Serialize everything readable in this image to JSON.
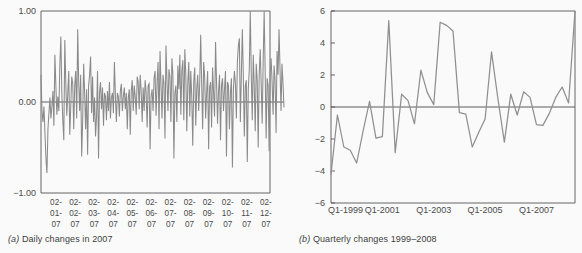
{
  "figure": {
    "background": "#fafafa",
    "line_color": "#8a8a8a",
    "axis_color": "#555555",
    "text_color": "#3d3d3d"
  },
  "panel_a": {
    "caption_label": "(a)",
    "caption_text": " Daily changes in 2007"
  },
  "panel_b": {
    "caption_label": "(b)",
    "caption_text": " Quarterly changes 1999–2008"
  },
  "chart_data": [
    {
      "id": "daily-changes-2007",
      "type": "line",
      "title": "(a) Daily changes in 2007",
      "xlabel": "",
      "ylabel": "",
      "ylim": [
        -1.0,
        1.0
      ],
      "yticks": [
        1.0,
        0.0,
        -1.0
      ],
      "ytick_labels": [
        "1.00",
        "0.00",
        "−1.00"
      ],
      "grid": false,
      "legend": "none",
      "zero_line": 0.0,
      "xtick_labels": [
        [
          "02-",
          "01-",
          "07"
        ],
        [
          "02-",
          "02-",
          "07"
        ],
        [
          "02-",
          "03-",
          "07"
        ],
        [
          "02-",
          "04-",
          "07"
        ],
        [
          "02-",
          "05-",
          "07"
        ],
        [
          "02-",
          "06-",
          "07"
        ],
        [
          "02-",
          "07-",
          "07"
        ],
        [
          "02-",
          "08-",
          "07"
        ],
        [
          "02-",
          "09-",
          "07"
        ],
        [
          "02-",
          "10-",
          "07"
        ],
        [
          "02-",
          "11-",
          "07"
        ],
        [
          "02-",
          "12-",
          "07"
        ]
      ],
      "values": [
        0.3,
        -0.1,
        -0.22,
        -0.05,
        -0.35,
        -0.62,
        -0.78,
        -0.3,
        -0.12,
        0.05,
        -0.18,
        -0.05,
        0.12,
        -0.26,
        0.52,
        0.18,
        -0.14,
        0.06,
        -0.1,
        0.4,
        0.72,
        0.1,
        -0.2,
        -0.42,
        0.68,
        0.2,
        -0.15,
        0.1,
        0.34,
        -0.36,
        -0.05,
        0.28,
        0.2,
        -0.3,
        0.18,
        0.34,
        -0.18,
        0.8,
        0.22,
        -0.1,
        0.3,
        -0.6,
        -0.2,
        0.42,
        0.1,
        -0.3,
        0.14,
        -0.58,
        0.18,
        0.3,
        0.5,
        -0.12,
        0.28,
        -0.22,
        0.05,
        -0.38,
        -0.16,
        0.34,
        -0.62,
        0.1,
        0.22,
        -0.08,
        0.16,
        -0.26,
        0.1,
        0.06,
        -0.2,
        0.12,
        -0.1,
        0.22,
        -0.18,
        0.05,
        0.1,
        -0.12,
        0.44,
        0.08,
        -0.22,
        0.1,
        0.06,
        -0.16,
        0.12,
        0.2,
        -0.1,
        0.06,
        0.16,
        -0.08,
        0.1,
        -0.3,
        0.05,
        0.14,
        -0.36,
        0.12,
        0.24,
        -0.1,
        0.18,
        0.06,
        -0.14,
        0.28,
        0.22,
        -0.08,
        0.3,
        0.12,
        -0.22,
        0.16,
        -0.1,
        0.24,
        0.1,
        -0.28,
        0.18,
        0.2,
        -0.52,
        0.06,
        0.14,
        -0.1,
        0.26,
        0.34,
        -0.15,
        0.2,
        0.44,
        -0.3,
        0.56,
        0.18,
        -0.18,
        0.3,
        0.2,
        -0.4,
        0.62,
        0.24,
        -0.1,
        0.36,
        0.28,
        -0.22,
        0.48,
        0.3,
        -0.62,
        0.1,
        0.18,
        -0.22,
        0.4,
        0.14,
        0.52,
        -0.14,
        0.34,
        0.46,
        -0.2,
        0.58,
        0.3,
        -0.32,
        0.2,
        0.44,
        -0.16,
        0.34,
        0.06,
        -0.48,
        0.22,
        0.38,
        -0.26,
        0.14,
        0.3,
        -0.1,
        0.2,
        0.74,
        0.2,
        -0.3,
        0.44,
        0.28,
        -0.18,
        0.1,
        0.34,
        -0.52,
        0.16,
        0.22,
        -0.28,
        0.38,
        0.1,
        -0.16,
        0.66,
        0.2,
        -0.24,
        0.12,
        0.3,
        -0.42,
        0.18,
        0.26,
        -0.1,
        0.14,
        0.34,
        -0.6,
        0.22,
        0.18,
        -0.3,
        0.1,
        0.26,
        -0.72,
        0.14,
        0.34,
        0.2,
        -0.18,
        0.44,
        0.62,
        0.7,
        -0.22,
        0.3,
        0.8,
        0.28,
        -0.38,
        0.18,
        0.24,
        -0.66,
        0.14,
        0.36,
        1.0,
        0.3,
        -0.2,
        0.52,
        0.18,
        -0.32,
        0.42,
        0.24,
        -0.5,
        0.3,
        0.58,
        0.2,
        -0.24,
        0.44,
        1.0,
        0.34,
        -0.4,
        0.26,
        0.18,
        -0.54,
        0.3,
        0.48,
        0.22,
        -0.14,
        0.4,
        0.24,
        -0.34,
        0.56,
        0.3,
        0.8,
        0.36,
        -0.1,
        0.42,
        0.2,
        -0.06
      ]
    },
    {
      "id": "quarterly-changes-1999-2008",
      "type": "line",
      "title": "(b) Quarterly changes 1999–2008",
      "xlabel": "",
      "ylabel": "",
      "ylim": [
        -6,
        6
      ],
      "yticks": [
        6,
        4,
        2,
        0,
        -2,
        -4,
        -6
      ],
      "ytick_labels": [
        "6",
        "4",
        "2",
        "0",
        "−2",
        "−4",
        "−6"
      ],
      "grid": false,
      "legend": "none",
      "zero_line": 0,
      "xtick_labels": [
        "Q1-1999",
        "Q1-2001",
        "Q1-2003",
        "Q1-2005",
        "Q1-2007"
      ],
      "xtick_positions": [
        0,
        8,
        16,
        24,
        32
      ],
      "values": [
        -4.2,
        -0.5,
        -2.5,
        -2.7,
        -3.5,
        -1.5,
        0.35,
        -1.95,
        -1.85,
        5.4,
        -2.85,
        0.8,
        0.4,
        -1.05,
        2.3,
        0.9,
        0.15,
        5.3,
        5.1,
        4.75,
        -0.35,
        -0.45,
        -2.5,
        -1.6,
        -0.75,
        3.45,
        0.5,
        -2.2,
        0.8,
        -0.5,
        0.95,
        0.6,
        -1.1,
        -1.15,
        -0.4,
        0.6,
        1.25,
        0.25,
        6.0
      ]
    }
  ]
}
